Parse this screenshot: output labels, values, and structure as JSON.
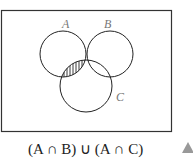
{
  "diagram": {
    "type": "venn",
    "sets": [
      {
        "label": "A",
        "cx": 63,
        "cy": 54,
        "r": 23
      },
      {
        "label": "B",
        "cx": 110,
        "cy": 54,
        "r": 23
      },
      {
        "label": "C",
        "cx": 86,
        "cy": 86,
        "r": 26
      }
    ],
    "shaded_regions": [
      "A ∩ B",
      "A ∩ C"
    ],
    "labels": {
      "A": "A",
      "B": "B",
      "C": "C"
    }
  },
  "caption": {
    "text": "(A ∩ B) ∪ (A ∩ C)"
  },
  "marker": {
    "icon": "triangle-icon",
    "color": "#999999"
  }
}
